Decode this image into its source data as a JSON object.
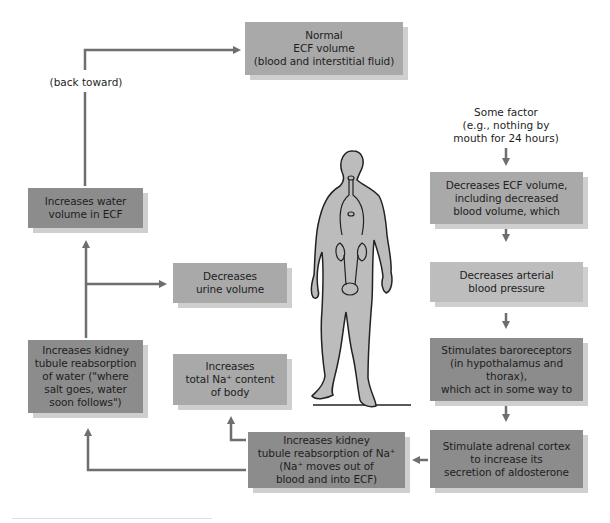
{
  "diagram": {
    "type": "feedback-flowchart",
    "colors": {
      "box_dark": "#8c8c8c",
      "box_mid": "#a9a9a9",
      "box_light": "#bdbdbd",
      "arrow": "#6e6e6e",
      "figure_fill": "#bcbcbc"
    },
    "labels": {
      "back_toward": "(back toward)",
      "some_factor": "Some factor\n(e.g., nothing by\nmouth for 24 hours)"
    },
    "boxes": {
      "normal_ecf": "Normal\nECF volume\n(blood and interstitial fluid)",
      "decreases_ecf": "Decreases ECF volume,\nincluding decreased\nblood volume, which",
      "decreases_bp": "Decreases arterial\nblood pressure",
      "stimulates_baroreceptors": "Stimulates baroreceptors\n(in hypothalamus and thorax),\nwhich act in some way to",
      "stimulate_adrenal": "Stimulate adrenal cortex\nto increase its\nsecretion of aldosterone",
      "increases_na_reabsorption": "Increases kidney\ntubule reabsorption of Na⁺\n(Na⁺ moves out of\nblood and into ECF)",
      "increases_total_na": "Increases\ntotal Na⁺ content\nof body",
      "increases_water_reabsorption": "Increases kidney\ntubule reabsorption\nof water (\"where\nsalt goes, water\nsoon follows\")",
      "decreases_urine": "Decreases\nurine volume",
      "increases_water_volume": "Increases water\nvolume in ECF"
    },
    "illustration": "human-figure-with-kidneys"
  }
}
